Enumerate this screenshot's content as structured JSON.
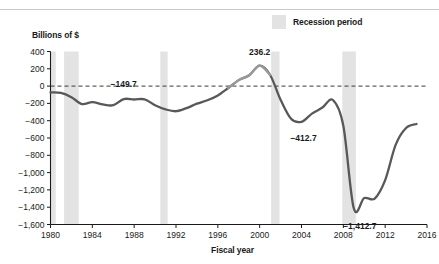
{
  "figure": {
    "background_color": "#ffffff",
    "line_color": "#58585a",
    "line_color_light": "#9a9a9c",
    "recession_band_color": "#e3e3e3",
    "axis_color": "#1a1a1a",
    "zero_line_style": "dashed"
  },
  "legend": {
    "position": "top-right",
    "entries": [
      {
        "label": "Recession period",
        "swatch_color": "#e3e3e3",
        "swatch_name": "recession-swatch"
      }
    ]
  },
  "chart_data": {
    "type": "line",
    "title": "",
    "subtitle": "",
    "xlabel": "Fiscal year",
    "ylabel": "Billions of $",
    "xlim": [
      1980,
      2016
    ],
    "ylim": [
      -1600,
      400
    ],
    "grid": false,
    "legend_position": "top-right",
    "xticks": [
      1980,
      1984,
      1988,
      1992,
      1996,
      2000,
      2004,
      2008,
      2012,
      2016
    ],
    "xticklabels": [
      "1980",
      "1984",
      "1988",
      "1992",
      "1996",
      "2000",
      "2004",
      "2008",
      "2012",
      "2016"
    ],
    "yticks": [
      400,
      200,
      0,
      -200,
      -400,
      -600,
      -800,
      -1000,
      -1200,
      -1400,
      -1600
    ],
    "yticklabels": [
      "400",
      "200",
      "0",
      "−200",
      "−400",
      "−600",
      "−800",
      "−1,000",
      "−1,200",
      "−1,400",
      "−1,600"
    ],
    "series": [
      {
        "name": "Federal surplus or deficit",
        "color": "#58585a",
        "x": [
          1980,
          1981,
          1982,
          1983,
          1984,
          1985,
          1986,
          1987,
          1988,
          1989,
          1990,
          1991,
          1992,
          1993,
          1994,
          1995,
          1996,
          1997,
          1998,
          1999,
          2000,
          2001,
          2002,
          2003,
          2004,
          2005,
          2006,
          2007,
          2008,
          2009,
          2010,
          2011,
          2012,
          2013,
          2014,
          2015
        ],
        "values": [
          -73.8,
          -79.0,
          -128.0,
          -207.8,
          -185.4,
          -212.3,
          -221.2,
          -149.7,
          -155.2,
          -152.6,
          -221.0,
          -269.2,
          -290.3,
          -255.1,
          -203.2,
          -164.0,
          -107.4,
          -21.9,
          69.3,
          125.6,
          236.2,
          128.2,
          -157.8,
          -377.6,
          -412.7,
          -318.3,
          -248.2,
          -160.7,
          -458.6,
          -1412.7,
          -1294.4,
          -1299.6,
          -1087.0,
          -679.5,
          -484.6,
          -438.0
        ]
      }
    ],
    "annotations": [
      {
        "label": "−149.7",
        "x": 1987,
        "y": -149.7,
        "name": "label-1987"
      },
      {
        "label": "236.2",
        "x": 2000,
        "y": 236.2,
        "name": "label-2000"
      },
      {
        "label": "−412.7",
        "x": 2004,
        "y": -412.7,
        "name": "label-2004"
      },
      {
        "label": "−1,412.7",
        "x": 2009,
        "y": -1412.7,
        "name": "label-2009"
      }
    ],
    "recession_bands": [
      {
        "start": 1980.0,
        "end": 1980.5,
        "name": "recession-1980"
      },
      {
        "start": 1981.3,
        "end": 1982.7,
        "name": "recession-1981-82"
      },
      {
        "start": 1990.5,
        "end": 1991.2,
        "name": "recession-1990-91"
      },
      {
        "start": 2001.1,
        "end": 2001.9,
        "name": "recession-2001"
      },
      {
        "start": 2007.9,
        "end": 2009.2,
        "name": "recession-2008-09"
      }
    ]
  }
}
